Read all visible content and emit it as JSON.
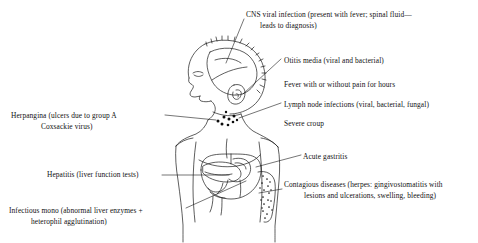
{
  "diagram": {
    "ink_color": "#1a1a1a",
    "background_color": "#ffffff"
  },
  "labels": {
    "cns": {
      "line1": "CNS viral infection (present with fever; spinal fluid—",
      "line2": "leads to diagnosis)"
    },
    "otitis": {
      "line1": "Otitis media (viral and bacterial)"
    },
    "fever": {
      "line1": "Fever with or without pain for hours"
    },
    "lymph": {
      "line1": "Lymph node infections (viral, bacterial, fungal)"
    },
    "croup": {
      "line1": "Severe croup"
    },
    "herpangina": {
      "line1": "Herpangina (ulcers due to group A",
      "line2": "Coxsackie virus)"
    },
    "gastritis": {
      "line1": "Acute gastritis"
    },
    "hepatitis": {
      "line1": "Hepatitis (liver function tests)"
    },
    "contagious": {
      "line1": "Contagious diseases (herpes: gingivostomatitis with",
      "line2": "lesions and ulcerations, swelling, bleeding)"
    },
    "mono": {
      "line1": "Infectious mono (abnormal liver enzymes +",
      "line2": "heterophil agglutination)"
    }
  }
}
